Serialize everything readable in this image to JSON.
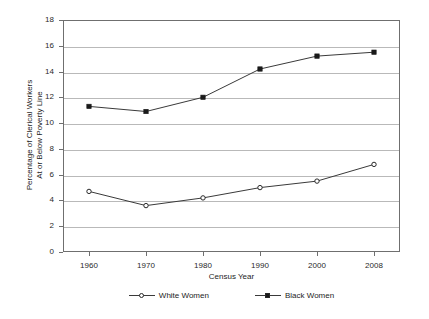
{
  "chart_data": {
    "type": "line",
    "title": "",
    "xlabel": "Census Year",
    "ylabel": "Percentage of Clerical Workers\nAt or Below Poverty Line",
    "ylabel_line1": "Percentage of Clerical Workers",
    "ylabel_line2": "At or Below Poverty Line",
    "categories": [
      "1960",
      "1970",
      "1980",
      "1990",
      "2000",
      "2008"
    ],
    "x": [
      1960,
      1970,
      1980,
      1990,
      2000,
      2008
    ],
    "ylim": [
      0,
      18
    ],
    "ytick_step": 2,
    "yticks": [
      "18",
      "16",
      "14",
      "12",
      "10",
      "8",
      "6",
      "4",
      "2",
      "0"
    ],
    "grid": true,
    "legend_position": "bottom",
    "series": [
      {
        "name": "White Women",
        "marker": "open-circle",
        "color": "#3a3a3a",
        "values": [
          4.7,
          3.6,
          4.2,
          5.0,
          5.5,
          6.8
        ]
      },
      {
        "name": "Black Women",
        "marker": "filled-square",
        "color": "#3a3a3a",
        "values": [
          11.3,
          10.9,
          12.0,
          14.2,
          15.2,
          15.5
        ]
      }
    ]
  },
  "legend": {
    "items": [
      {
        "label": "White Women"
      },
      {
        "label": "Black Women"
      }
    ]
  },
  "colors": {
    "axis": "#6f6f6f",
    "grid": "#b9b9b9",
    "line": "#3a3a3a",
    "text": "#1d1d1d",
    "background": "#ffffff"
  }
}
